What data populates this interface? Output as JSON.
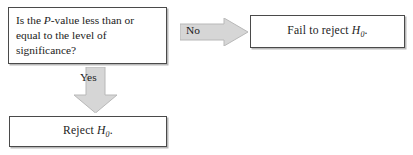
{
  "diagram": {
    "colors": {
      "arrow_fill": "#d6d6d6",
      "arrow_edge": "#b0b0b0",
      "box_border": "#4a4a4a",
      "box_shadow": "#b9b9b9",
      "text": "#1b1b1b",
      "background": "#ffffff"
    },
    "decision": {
      "name": "p-value-decision",
      "line1_a": "Is the ",
      "line1_italic": "P",
      "line1_b": "-value less than or",
      "line2": "equal to the level of",
      "line3": "significance?"
    },
    "branches": {
      "no": {
        "label": "No",
        "arrow_icon": "arrow-right-icon",
        "direction": "right"
      },
      "yes": {
        "label": "Yes",
        "arrow_icon": "arrow-down-icon",
        "direction": "down"
      }
    },
    "outcomes": {
      "fail_reject": {
        "prefix": "Fail to reject ",
        "symbol": "H",
        "subscript": "0",
        "suffix": "."
      },
      "reject": {
        "prefix": "Reject ",
        "symbol": "H",
        "subscript": "0",
        "suffix": "."
      }
    }
  }
}
